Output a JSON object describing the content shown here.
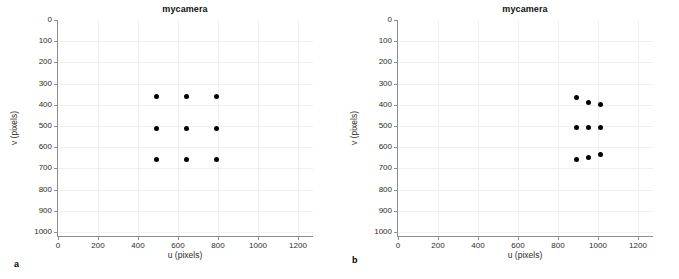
{
  "figure": {
    "panels": [
      {
        "letter": "a",
        "title": "mycamera",
        "xlabel": "u (pixels)",
        "ylabel": "v (pixels)"
      },
      {
        "letter": "b",
        "title": "mycamera",
        "xlabel": "u (pixels)",
        "ylabel": "v (pixels)"
      }
    ]
  },
  "chart_data": [
    {
      "type": "scatter",
      "panel": "a",
      "title": "mycamera",
      "xlabel": "u (pixels)",
      "ylabel": "v (pixels)",
      "xlim": [
        0,
        1280
      ],
      "ylim": [
        0,
        1024
      ],
      "y_inverted": true,
      "grid": true,
      "legend": "none",
      "xticks": [
        0,
        200,
        400,
        600,
        800,
        1000,
        1200
      ],
      "yticks": [
        0,
        100,
        200,
        300,
        400,
        500,
        600,
        700,
        800,
        900,
        1000
      ],
      "marker": "filled-circle",
      "marker_color": "#000000",
      "x": [
        490,
        640,
        790,
        490,
        640,
        790,
        490,
        640,
        790
      ],
      "y": [
        360,
        360,
        360,
        510,
        510,
        510,
        660,
        660,
        660
      ],
      "points": [
        {
          "u": 490,
          "v": 360
        },
        {
          "u": 640,
          "v": 360
        },
        {
          "u": 790,
          "v": 360
        },
        {
          "u": 490,
          "v": 510
        },
        {
          "u": 640,
          "v": 510
        },
        {
          "u": 790,
          "v": 510
        },
        {
          "u": 490,
          "v": 660
        },
        {
          "u": 640,
          "v": 660
        },
        {
          "u": 790,
          "v": 660
        }
      ]
    },
    {
      "type": "scatter",
      "panel": "b",
      "title": "mycamera",
      "xlabel": "u (pixels)",
      "ylabel": "v (pixels)",
      "xlim": [
        0,
        1280
      ],
      "ylim": [
        0,
        1024
      ],
      "y_inverted": true,
      "grid": true,
      "legend": "none",
      "xticks": [
        0,
        200,
        400,
        600,
        800,
        1000,
        1200
      ],
      "yticks": [
        0,
        100,
        200,
        300,
        400,
        500,
        600,
        700,
        800,
        900,
        1000
      ],
      "marker": "filled-circle",
      "marker_color": "#000000",
      "x": [
        890,
        952,
        1014,
        890,
        952,
        1014,
        890,
        952,
        1014
      ],
      "y": [
        368,
        387,
        397,
        508,
        508,
        508,
        658,
        647,
        637
      ],
      "points": [
        {
          "u": 890,
          "v": 368
        },
        {
          "u": 952,
          "v": 387
        },
        {
          "u": 1014,
          "v": 397
        },
        {
          "u": 890,
          "v": 508
        },
        {
          "u": 952,
          "v": 508
        },
        {
          "u": 1014,
          "v": 508
        },
        {
          "u": 890,
          "v": 658
        },
        {
          "u": 952,
          "v": 647
        },
        {
          "u": 1014,
          "v": 637
        }
      ]
    }
  ],
  "style": {
    "axis_color": "#8d8d8d",
    "grid_color": "#f0f0f2",
    "marker_color": "#000000",
    "text_color": "#2b2b2b",
    "background": "#ffffff"
  }
}
